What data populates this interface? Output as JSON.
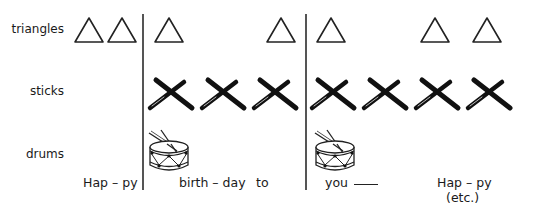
{
  "rows": {
    "triangles": "triangles",
    "sticks": "sticks",
    "drums": "drums"
  },
  "triangles_x": [
    74,
    107,
    154,
    266,
    316,
    420,
    472
  ],
  "sticks_x": [
    146,
    198,
    250,
    308,
    360,
    412,
    464
  ],
  "drums_x": [
    147,
    313
  ],
  "barlines_x": [
    142,
    305
  ],
  "lyrics": {
    "hap1": "Hap – py",
    "birthday": "birth – day",
    "to": "to",
    "you": "you",
    "hap2": "Hap – py",
    "etc": "(etc.)"
  }
}
